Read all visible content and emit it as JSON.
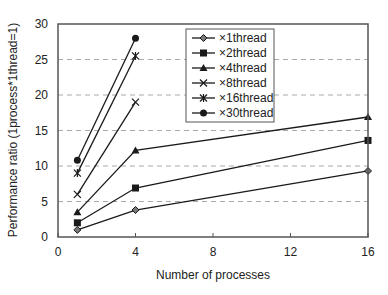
{
  "chart_data": {
    "type": "line",
    "title": "",
    "xlabel": "Number of processes",
    "ylabel": "Performance ratio (1process*1thread=1)",
    "xlim": [
      0,
      16
    ],
    "ylim": [
      0,
      30
    ],
    "xticks": [
      0,
      4,
      8,
      12,
      16
    ],
    "yticks": [
      0,
      5,
      10,
      15,
      20,
      25,
      30
    ],
    "grid": {
      "y": true,
      "x": false,
      "style": "dashed"
    },
    "legend_position": "upper-center-inside",
    "series": [
      {
        "name": "×1thread",
        "marker": "diamond",
        "x": [
          1,
          4,
          16
        ],
        "values": [
          1.0,
          3.8,
          9.3
        ]
      },
      {
        "name": "×2thread",
        "marker": "square",
        "x": [
          1,
          4,
          16
        ],
        "values": [
          2.0,
          6.9,
          13.6
        ]
      },
      {
        "name": "×4thread",
        "marker": "triangle",
        "x": [
          1,
          4,
          16
        ],
        "values": [
          3.5,
          12.2,
          16.9
        ]
      },
      {
        "name": "×8thread",
        "marker": "x",
        "x": [
          1,
          4
        ],
        "values": [
          6.0,
          19.0
        ]
      },
      {
        "name": "×16thread",
        "marker": "star",
        "x": [
          1,
          4
        ],
        "values": [
          9.0,
          25.5
        ]
      },
      {
        "name": "×30thread",
        "marker": "circle",
        "x": [
          1,
          4
        ],
        "values": [
          10.8,
          28.0
        ]
      }
    ]
  },
  "colors": {
    "line": "#1a1a1a",
    "frame": "#555555",
    "grid": "#aaaaaa",
    "background": "#ffffff"
  }
}
